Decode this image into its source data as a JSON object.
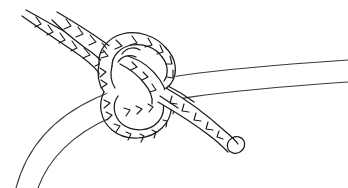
{
  "figure": {
    "title": "Rope hitch knot line drawing",
    "subject": "knot",
    "medium": "black ink line art",
    "background_color": "#ffffff",
    "line_color": "#1a1a1a",
    "secondary_line_color": "#3a3a3a",
    "width": 348,
    "height": 188,
    "caption": ""
  },
  "elements": {
    "smooth_rope": {
      "name": "smooth rope",
      "description": "Plain untextured rope or spar curving from the lower-left corner up to the middle-right edge, passing behind the knot",
      "style": "two thin parallel outline curves, no lay marks",
      "enters_at": "bottom-left",
      "exits_at": "right edge",
      "stroke": "#3a3a3a"
    },
    "standing_part": {
      "name": "standing part",
      "description": "Twisted laid rope entering from the upper-left corner toward the knot",
      "style": "tapered tube with chevron lay marks",
      "enters_at": "top-left",
      "stroke": "#1a1a1a"
    },
    "knot_body": {
      "name": "knot body",
      "description": "Central loop of twisted rope wrapped around the smooth rope forming the hitch",
      "style": "overlapping rounded loops with chevron lay marks",
      "stroke": "#1a1a1a"
    },
    "working_end": {
      "name": "working end",
      "description": "Twisted rope tail leaving the knot toward the lower right, finishing in a rounded cut end",
      "style": "tapered tube with chevron lay marks ending in an ellipse",
      "exits_at": "lower-right",
      "stroke": "#1a1a1a"
    },
    "cut_end": {
      "name": "cut end",
      "description": "Small rounded ellipse showing the sliced tip of the rope tail",
      "center_x": 236,
      "center_y": 145,
      "stroke": "#1a1a1a"
    }
  }
}
